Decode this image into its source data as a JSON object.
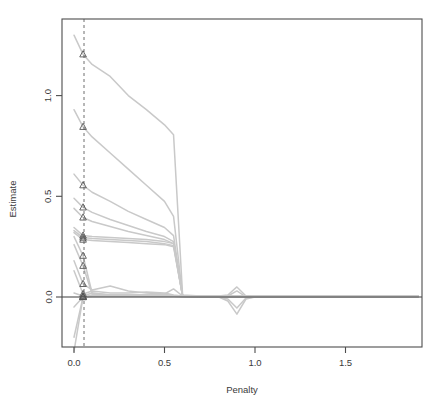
{
  "chart": {
    "title": "",
    "xlabel": "Penalty",
    "ylabel": "Estimate"
  },
  "axes": {
    "x_ticks": [
      "0.0",
      "0.5",
      "1.0",
      "1.5"
    ],
    "y_ticks": [
      "0.0",
      "0.5",
      "1.0"
    ]
  },
  "colors": {
    "line": "#c9c9c9",
    "marker_stroke": "#555555",
    "axis": "#4d4d4d",
    "zero_line": "#3c3c3c",
    "dashed_line": "#6e6e6e",
    "text": "#3a3a3a",
    "background": "#ffffff"
  },
  "chart_data": {
    "type": "line",
    "title": "",
    "xlabel": "Penalty",
    "ylabel": "Estimate",
    "xlim": [
      -0.07,
      1.92
    ],
    "ylim": [
      -0.28,
      1.33
    ],
    "grid": false,
    "legend": null,
    "x_ticks": [
      0.0,
      0.5,
      1.0,
      1.5
    ],
    "y_ticks": [
      0.0,
      0.5,
      1.0
    ],
    "annotations": [
      {
        "name": "selected-penalty-dashed-line",
        "type": "vline",
        "x": 0.05,
        "style": "dashed"
      },
      {
        "name": "zero-reference-line",
        "type": "hline",
        "y": 0.0,
        "style": "solid"
      }
    ],
    "marker": {
      "symbol": "triangle-open",
      "at_x": 0.05
    },
    "x": [
      0.0,
      0.05,
      0.1,
      0.2,
      0.3,
      0.4,
      0.5,
      0.55,
      0.6,
      0.7,
      0.8,
      0.85,
      0.9,
      0.95,
      1.0,
      1.2,
      1.5,
      1.9
    ],
    "series": [
      {
        "name": "coef-1",
        "marker_value": 1.205,
        "values": [
          1.3,
          1.205,
          1.155,
          1.095,
          1.0,
          0.93,
          0.855,
          0.805,
          0.01,
          0.005,
          0.005,
          0.005,
          0.005,
          0.005,
          0.005,
          0.005,
          0.005,
          0.005
        ]
      },
      {
        "name": "coef-2",
        "marker_value": 0.845,
        "values": [
          0.93,
          0.845,
          0.795,
          0.715,
          0.635,
          0.555,
          0.475,
          0.4,
          0.005,
          0.005,
          0.005,
          0.005,
          0.005,
          0.005,
          0.005,
          0.005,
          0.005,
          0.005
        ]
      },
      {
        "name": "coef-3",
        "marker_value": 0.555,
        "values": [
          0.61,
          0.555,
          0.52,
          0.475,
          0.425,
          0.385,
          0.345,
          0.305,
          0.005,
          0.005,
          0.005,
          0.005,
          0.005,
          0.005,
          0.005,
          0.005,
          0.005,
          0.005
        ]
      },
      {
        "name": "coef-4",
        "marker_value": 0.445,
        "values": [
          0.49,
          0.445,
          0.42,
          0.385,
          0.355,
          0.325,
          0.3,
          0.275,
          0.005,
          0.005,
          0.005,
          0.005,
          0.005,
          0.005,
          0.005,
          0.005,
          0.005,
          0.005
        ]
      },
      {
        "name": "coef-5",
        "marker_value": 0.395,
        "values": [
          0.44,
          0.395,
          0.375,
          0.35,
          0.325,
          0.305,
          0.285,
          0.265,
          0.005,
          0.005,
          0.005,
          0.005,
          0.005,
          0.005,
          0.005,
          0.005,
          0.005,
          0.005
        ]
      },
      {
        "name": "coef-6",
        "marker_value": 0.305,
        "values": [
          0.345,
          0.305,
          0.3,
          0.295,
          0.29,
          0.285,
          0.275,
          0.265,
          0.005,
          0.005,
          0.005,
          0.005,
          0.005,
          0.005,
          0.005,
          0.005,
          0.005,
          0.005
        ]
      },
      {
        "name": "coef-7",
        "marker_value": 0.295,
        "values": [
          0.33,
          0.295,
          0.29,
          0.285,
          0.28,
          0.275,
          0.265,
          0.255,
          0.005,
          0.005,
          0.005,
          0.005,
          0.005,
          0.005,
          0.005,
          0.005,
          0.005,
          0.005
        ]
      },
      {
        "name": "coef-8",
        "marker_value": 0.285,
        "values": [
          0.32,
          0.285,
          0.28,
          0.275,
          0.27,
          0.265,
          0.26,
          0.25,
          0.005,
          0.005,
          0.005,
          0.005,
          0.005,
          0.005,
          0.005,
          0.005,
          0.005,
          0.005
        ]
      },
      {
        "name": "coef-9",
        "marker_value": 0.205,
        "values": [
          0.3,
          0.205,
          0.02,
          0.01,
          0.01,
          0.01,
          0.01,
          0.005,
          0.005,
          0.005,
          0.005,
          0.005,
          0.005,
          0.005,
          0.005,
          0.005,
          0.005,
          0.005
        ]
      },
      {
        "name": "coef-10",
        "marker_value": 0.155,
        "values": [
          0.26,
          0.155,
          0.015,
          0.01,
          0.01,
          0.01,
          0.01,
          0.005,
          0.005,
          0.005,
          0.005,
          0.005,
          0.005,
          0.005,
          0.005,
          0.005,
          0.005,
          0.005
        ]
      },
      {
        "name": "coef-11",
        "marker_value": 0.065,
        "values": [
          0.18,
          0.065,
          0.035,
          0.055,
          0.03,
          0.02,
          0.015,
          0.04,
          0.005,
          0.005,
          0.005,
          0.01,
          0.05,
          0.005,
          0.0,
          0.0,
          0.0,
          0.0
        ]
      },
      {
        "name": "coef-12",
        "marker_value": 0.015,
        "values": [
          0.13,
          0.015,
          0.03,
          0.02,
          0.02,
          0.025,
          0.02,
          0.01,
          0.005,
          0.005,
          0.005,
          0.005,
          0.03,
          0.0,
          0.0,
          0.0,
          0.0,
          0.0
        ]
      },
      {
        "name": "coef-13",
        "marker_value": 0.005,
        "values": [
          0.02,
          0.005,
          0.02,
          0.01,
          0.01,
          0.01,
          0.012,
          0.008,
          0.005,
          0.0,
          0.0,
          -0.01,
          -0.055,
          -0.005,
          0.0,
          0.0,
          0.0,
          0.0
        ]
      },
      {
        "name": "coef-14",
        "marker_value": 0.0,
        "values": [
          -0.05,
          0.0,
          0.01,
          0.008,
          0.008,
          0.008,
          0.008,
          0.006,
          0.003,
          0.0,
          0.0,
          -0.02,
          -0.085,
          -0.01,
          0.0,
          0.0,
          0.0,
          0.0
        ]
      },
      {
        "name": "coef-15",
        "marker_value": 0.0,
        "values": [
          -0.2,
          0.0,
          0.005,
          0.005,
          0.005,
          0.005,
          0.005,
          0.004,
          0.002,
          0.0,
          0.0,
          0.0,
          0.0,
          0.0,
          0.0,
          0.0,
          0.0,
          0.0
        ]
      },
      {
        "name": "coef-16",
        "marker_value": 0.0,
        "values": [
          -0.27,
          0.0,
          0.003,
          0.003,
          0.003,
          0.003,
          0.003,
          0.002,
          0.001,
          0.0,
          0.0,
          0.0,
          0.0,
          0.0,
          0.0,
          0.0,
          0.0,
          0.0
        ]
      }
    ]
  }
}
